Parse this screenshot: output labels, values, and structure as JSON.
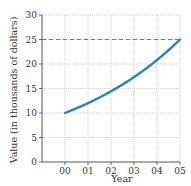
{
  "chart_data": {
    "type": "line",
    "title": "",
    "xlabel": "Year",
    "ylabel": "Value (in thousands of dollars)",
    "x_tick_labels": [
      "00",
      "01",
      "02",
      "03",
      "04",
      "05"
    ],
    "y_tick_labels": [
      "0",
      "5",
      "10",
      "15",
      "20",
      "25",
      "30"
    ],
    "xlim": [
      0,
      5
    ],
    "ylim": [
      0,
      30
    ],
    "grid": true,
    "series": [
      {
        "name": "Value",
        "color": "#2f7fc1",
        "x": [
          0,
          1,
          2,
          3,
          4,
          5
        ],
        "values": [
          10,
          12.0,
          14.4,
          17.3,
          20.8,
          25
        ]
      }
    ],
    "reference_lines": [
      {
        "type": "horizontal",
        "y": 25,
        "style": "dashed",
        "color": "#777777"
      }
    ]
  }
}
